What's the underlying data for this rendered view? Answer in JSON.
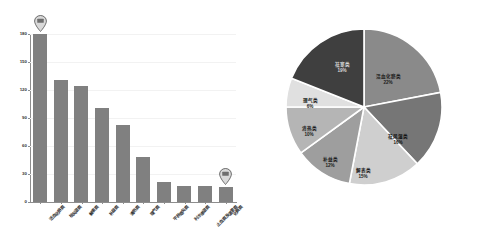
{
  "chart_data": [
    {
      "type": "bar",
      "title": "",
      "xlabel": "",
      "ylabel": "",
      "ylim": [
        0,
        180
      ],
      "yticks": [
        0,
        30,
        60,
        90,
        120,
        150,
        180
      ],
      "grid": true,
      "legend": "none",
      "bar_color": "#808080",
      "categories": [
        "活血化瘀类",
        "祛风湿类",
        "解表类",
        "补益类",
        "清热类",
        "理气类",
        "平肝熄风类",
        "利水渗湿类",
        "止血类及温里类",
        "化痰类"
      ],
      "values": [
        180,
        131,
        124,
        101,
        83,
        48,
        21,
        17,
        17,
        16
      ],
      "annotations": [
        {
          "name": "marker-first-bar",
          "icon": "map-pin-icon",
          "at_category": "活血化瘀类"
        },
        {
          "name": "marker-last-bar",
          "icon": "map-pin-icon",
          "at_category": "化痰类"
        }
      ]
    },
    {
      "type": "pie",
      "title": "",
      "start_angle_deg": 0,
      "direction": "clockwise",
      "labels": [
        "活血化瘀类",
        "祛风湿类",
        "解表类",
        "补益类",
        "清热类",
        "理气类",
        "祛寒类"
      ],
      "values": [
        22,
        16,
        15,
        12,
        10,
        6,
        19
      ],
      "value_labels": [
        "22%",
        "16%",
        "15%",
        "12%",
        "10%",
        "6%",
        "19%"
      ],
      "colors": [
        "#8a8a8a",
        "#767676",
        "#cfcfcf",
        "#9e9e9e",
        "#b5b5b5",
        "#e0e0e0",
        "#3f3f3f"
      ],
      "label_text_colors": [
        "#1a1a1a",
        "#111111",
        "#1a1a1a",
        "#1a1a1a",
        "#1a1a1a",
        "#1a1a1a",
        "#d8d8d8"
      ],
      "label_positions": [
        {
          "x": 103,
          "y": 52
        },
        {
          "x": 113,
          "y": 112
        },
        {
          "x": 78,
          "y": 146
        },
        {
          "x": 45,
          "y": 135
        },
        {
          "x": 24,
          "y": 104
        },
        {
          "x": 25,
          "y": 76
        },
        {
          "x": 57,
          "y": 40
        }
      ],
      "slice_separator_color": "#ffffff"
    }
  ]
}
